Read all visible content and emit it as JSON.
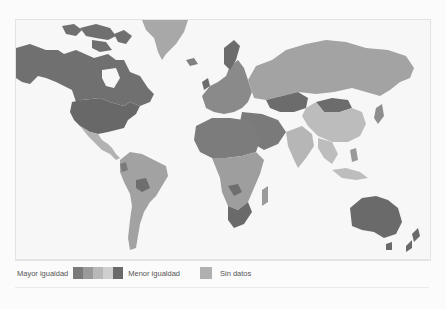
{
  "legend": {
    "high_label": "Mayor igualdad",
    "low_label": "Menor igualdad",
    "no_data_label": "Sin datos",
    "scale_colors": [
      "#7a7a7a",
      "#9a9a9a",
      "#b8b8b8",
      "#cfcfcf",
      "#6a6a6a"
    ],
    "no_data_color": "#b0b0b0"
  },
  "map": {
    "ocean_color": "#f7f7f7",
    "regions": [
      {
        "name": "Canada",
        "shade": "#707070"
      },
      {
        "name": "United States",
        "shade": "#686868"
      },
      {
        "name": "Alaska",
        "shade": "#707070"
      },
      {
        "name": "Greenland",
        "shade": "#a8a8a8"
      },
      {
        "name": "Mexico / Central America",
        "shade": "#b2b2b2"
      },
      {
        "name": "South America",
        "shade": "#a2a2a2"
      },
      {
        "name": "Bolivia",
        "shade": "#6e6e6e"
      },
      {
        "name": "Europe",
        "shade": "#8a8a8a"
      },
      {
        "name": "Russia",
        "shade": "#a3a3a3"
      },
      {
        "name": "Kazakhstan",
        "shade": "#6c6c6c"
      },
      {
        "name": "Mongolia",
        "shade": "#6c6c6c"
      },
      {
        "name": "China",
        "shade": "#bcbcbc"
      },
      {
        "name": "Middle East",
        "shade": "#7a7a7a"
      },
      {
        "name": "India",
        "shade": "#b6b6b6"
      },
      {
        "name": "Africa North",
        "shade": "#7c7c7c"
      },
      {
        "name": "Africa Central",
        "shade": "#9e9e9e"
      },
      {
        "name": "South Africa",
        "shade": "#6a6a6a"
      },
      {
        "name": "Madagascar",
        "shade": "#9a9a9a"
      },
      {
        "name": "Southeast Asia",
        "shade": "#bdbdbd"
      },
      {
        "name": "Australia",
        "shade": "#6a6a6a"
      },
      {
        "name": "New Zealand",
        "shade": "#6a6a6a"
      },
      {
        "name": "Japan",
        "shade": "#8e8e8e"
      }
    ]
  }
}
